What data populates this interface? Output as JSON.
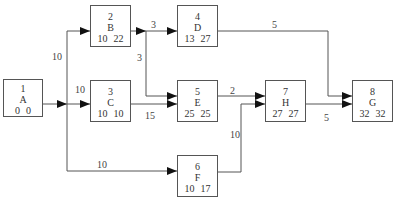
{
  "diagram": {
    "type": "activity-on-node network",
    "nodes": [
      {
        "id": "1",
        "label": "A",
        "es": "0",
        "ls": "0",
        "x": 3,
        "y": 79,
        "w": 40,
        "h": 38
      },
      {
        "id": "2",
        "label": "B",
        "es": "10",
        "ls": "22",
        "x": 90,
        "y": 5,
        "w": 41,
        "h": 42
      },
      {
        "id": "3",
        "label": "C",
        "es": "10",
        "ls": "10",
        "x": 90,
        "y": 80,
        "w": 41,
        "h": 42
      },
      {
        "id": "4",
        "label": "D",
        "es": "13",
        "ls": "27",
        "x": 177,
        "y": 5,
        "w": 41,
        "h": 42
      },
      {
        "id": "5",
        "label": "E",
        "es": "25",
        "ls": "25",
        "x": 177,
        "y": 80,
        "w": 41,
        "h": 42
      },
      {
        "id": "6",
        "label": "F",
        "es": "10",
        "ls": "17",
        "x": 177,
        "y": 155,
        "w": 41,
        "h": 42
      },
      {
        "id": "7",
        "label": "H",
        "es": "27",
        "ls": "27",
        "x": 265,
        "y": 80,
        "w": 41,
        "h": 42
      },
      {
        "id": "8",
        "label": "G",
        "es": "32",
        "ls": "32",
        "x": 352,
        "y": 80,
        "w": 41,
        "h": 42
      }
    ],
    "edge_labels": [
      {
        "text": "10",
        "x": 52,
        "y": 52,
        "edge": "A-B"
      },
      {
        "text": "10",
        "x": 75,
        "y": 85,
        "edge": "A-C"
      },
      {
        "text": "10",
        "x": 97,
        "y": 160,
        "edge": "A-F"
      },
      {
        "text": "3",
        "x": 151,
        "y": 20,
        "edge": "B-D"
      },
      {
        "text": "3",
        "x": 137,
        "y": 53,
        "edge": "B-E"
      },
      {
        "text": "15",
        "x": 145,
        "y": 111,
        "edge": "C-E"
      },
      {
        "text": "5",
        "x": 272,
        "y": 20,
        "edge": "D-G"
      },
      {
        "text": "2",
        "x": 230,
        "y": 86,
        "edge": "E-H"
      },
      {
        "text": "10",
        "x": 230,
        "y": 130,
        "edge": "F-H"
      },
      {
        "text": "5",
        "x": 324,
        "y": 113,
        "edge": "H-G"
      }
    ],
    "colors": {
      "line": "#555555",
      "arrow": "#111111",
      "text": "#333333"
    }
  }
}
